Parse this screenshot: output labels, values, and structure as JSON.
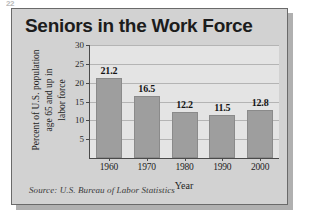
{
  "page_corner_mark": "22",
  "figure": {
    "title": "Seniors in the Work Force",
    "source_note": "Source: U.S. Bureau of Labor Statistics",
    "panel_color": "#d2d2d2",
    "plot_background": "#e4e4e4",
    "bar_color": "#9e9e9e",
    "border_color": "#6a6a6a"
  },
  "y_axis_title_lines": [
    "Percent of U.S. population",
    "age 65 and up in",
    "labor force"
  ],
  "chart_data": {
    "type": "bar",
    "title": "Seniors in the Work Force",
    "categories": [
      "1960",
      "1970",
      "1980",
      "1990",
      "2000"
    ],
    "values": [
      21.2,
      16.5,
      12.2,
      11.5,
      12.8
    ],
    "value_labels": [
      "21.2",
      "16.5",
      "12.2",
      "11.5",
      "12.8"
    ],
    "xlabel": "Year",
    "ylabel": "Percent of U.S. population age 65 and up in labor force",
    "ylim": [
      0,
      30
    ],
    "yticks": [
      5,
      10,
      15,
      20,
      25,
      30
    ],
    "ytick_labels": [
      "5",
      "10",
      "15",
      "20",
      "25",
      "30"
    ],
    "grid": true,
    "legend": false,
    "source": "Source: U.S. Bureau of Labor Statistics"
  }
}
